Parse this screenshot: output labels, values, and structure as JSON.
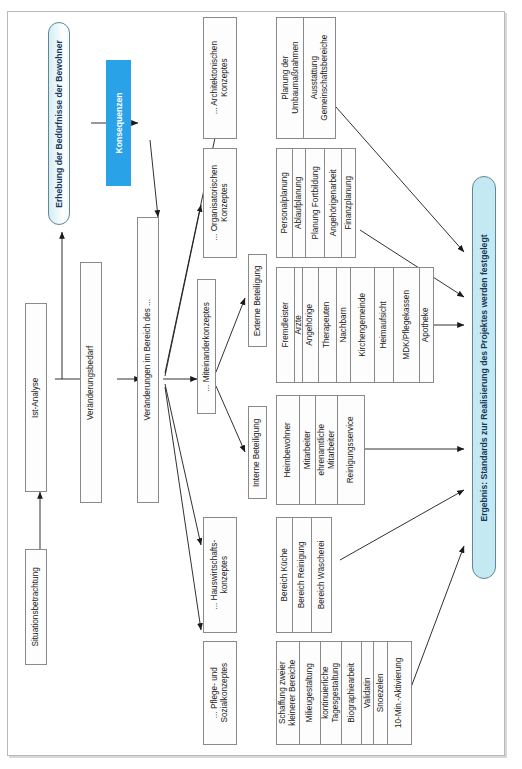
{
  "diagram": {
    "accent_blue": "#2aa2e8",
    "lozenge_blue": "#c5e9f2",
    "box_border": "#8a8a8a"
  },
  "nodes": {
    "situationsbetrachtung": {
      "label": "Situationsbetrachtung"
    },
    "ist_analyse": {
      "label": "Ist-Analyse"
    },
    "veraenderungsbedarf": {
      "label": "Veränderungsbedarf"
    },
    "veraenderungen_bereich": {
      "label": "Veränderungen im Bereich des ..."
    },
    "erhebung": {
      "label": "Erhebung der Bedürfnisse der Bewohner"
    },
    "konsequenzen": {
      "label": "Konsequenzen"
    },
    "architektonisches": {
      "label": "... Architektonischen\nKonzeptes"
    },
    "organisatorisches": {
      "label": "... Organisatorischen\nKonzeptes"
    },
    "miteinander": {
      "label": "... Miteinanderkonzeptes"
    },
    "hauswirtschaft": {
      "label": "... Hauswirtschafts-\nkonzeptes"
    },
    "pflege_sozial": {
      "label": "... Pflege- und\nSozialkonzeptes"
    },
    "externe_beteiligung": {
      "label": "Externe Beteiligung"
    },
    "interne_beteiligung": {
      "label": "Interne Beteiligung"
    },
    "ergebnis": {
      "label": "Ergebnis: Standards zur Realisierung des Projektes werden festgelegt"
    }
  },
  "groups": {
    "architektur_massnahmen": {
      "name": "architektur-massnahmen-gruppe",
      "items": [
        "Planung der\nUmbaumaßnahmen",
        "Ausstattung\nGemeinschaftsbereiche"
      ]
    },
    "organisation_massnahmen": {
      "name": "organisation-massnahmen-gruppe",
      "items": [
        "Personalplanung",
        "Ablaufplanung",
        "Planung Fortbildung",
        "Angehörigenarbeit",
        "Finanzplanung"
      ]
    },
    "externe_liste": {
      "name": "externe-beteiligung-liste",
      "items": [
        "Fremdleister",
        "Ärzte",
        "Angehörige",
        "Therapeuten",
        "Nachbarn",
        "Kirchengemeinde",
        "Heimaufsicht",
        "MDK/Pflegekassen",
        "Apotheke"
      ]
    },
    "interne_liste": {
      "name": "interne-beteiligung-liste",
      "items": [
        "Heimbewohner",
        "Mitarbeiter",
        "ehrenamtliche\nMitarbeiter",
        "Reinigungsservice"
      ]
    },
    "hauswirtschaft_liste": {
      "name": "hauswirtschaft-bereiche-liste",
      "items": [
        "Bereich Küche",
        "Bereich Reinigung",
        "Bereich Wäscherei"
      ]
    },
    "pflege_liste": {
      "name": "pflege-sozial-massnahmen-liste",
      "items": [
        "Schaffung zweier\nkleinerer Bereiche",
        "Milieugestaltung",
        "kontinuierliche\nTagesgestaltung",
        "Biographiearbeit",
        "Validatin",
        "Snoezelen",
        "10-Min.-Aktivierung"
      ]
    }
  }
}
